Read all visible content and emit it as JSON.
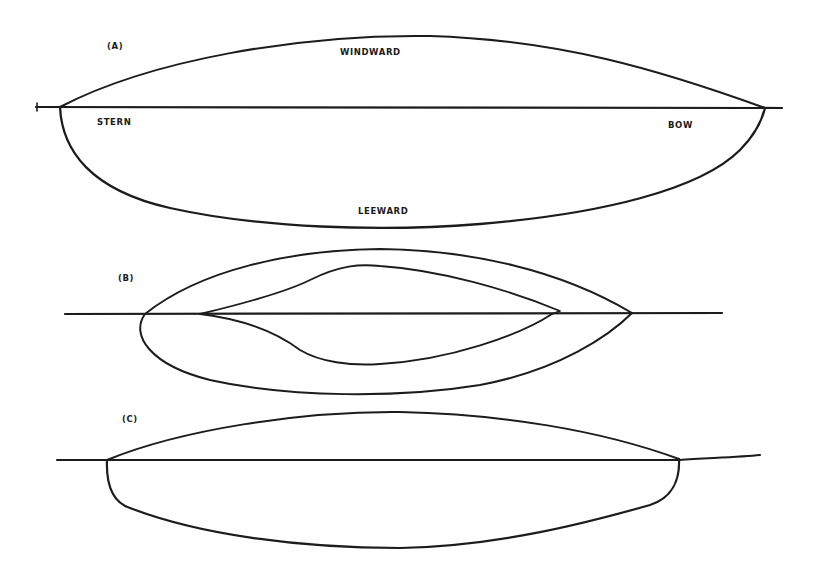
{
  "figures": [
    {
      "id": "A",
      "label": "(A)",
      "annotations": {
        "windward": "WINDWARD",
        "leeward": "LEEWARD",
        "stern": "STERN",
        "bow": "BOW"
      }
    },
    {
      "id": "B",
      "label": "(B)"
    },
    {
      "id": "C",
      "label": "(C)"
    }
  ],
  "colors": {
    "ink": "#1c1c1c",
    "background": "#ffffff"
  }
}
